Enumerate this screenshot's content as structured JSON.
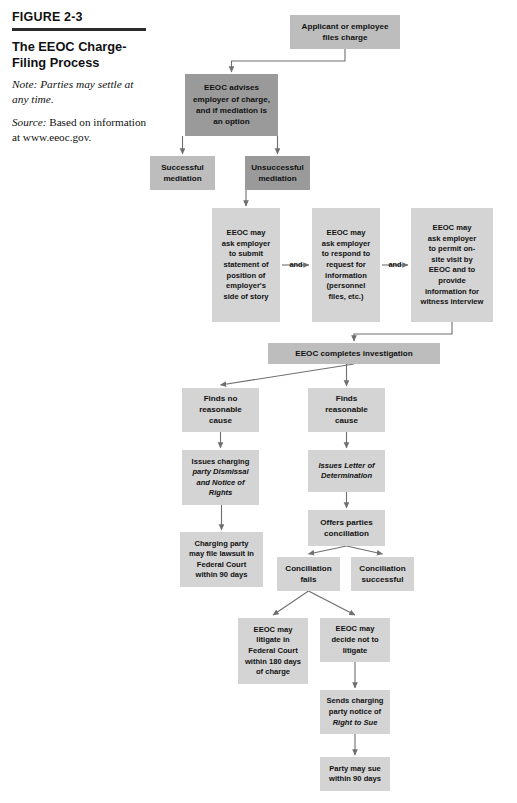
{
  "caption": {
    "figure_number": "FIGURE 2-3",
    "title": "The EEOC Charge-Filing Process",
    "note_label": "Note:",
    "note_text": "Note: Parties may settle at any time.",
    "source_label": "Source:",
    "source_text": "Based on information at www.eeoc.gov."
  },
  "colors": {
    "box_light": "#d4d4d4",
    "box_medium": "#bdbdbd",
    "box_dark": "#9a9a9a",
    "connector": "#6f6f6f",
    "rule": "#2b2b2b",
    "text": "#111111",
    "page_background": "#ffffff"
  },
  "chart_data": {
    "type": "flowchart",
    "title": "The EEOC Charge-Filing Process",
    "note": "Parties may settle at any time.",
    "source": "Based on information at www.eeoc.gov.",
    "nodes": [
      {
        "id": "applicant-files",
        "label": "Applicant or employee files charge",
        "lines": [
          "Applicant or employee",
          "files charge"
        ],
        "x": 290,
        "y": 15,
        "w": 110,
        "h": 34,
        "fill": "box_medium",
        "size": "big"
      },
      {
        "id": "eeoc-advises",
        "label": "EEOC advises employer of charge, and if mediation is an option",
        "lines": [
          "EEOC advises",
          "employer of charge,",
          "and if mediation is",
          "an option"
        ],
        "x": 185,
        "y": 74,
        "w": 93,
        "h": 62,
        "fill": "box_dark",
        "size": "big"
      },
      {
        "id": "successful-mediation",
        "label": "Successful mediation",
        "lines": [
          "Successful",
          "mediation"
        ],
        "x": 150,
        "y": 156,
        "w": 65,
        "h": 34,
        "fill": "box_medium",
        "size": "big"
      },
      {
        "id": "unsuccessful-mediation",
        "label": "Unsuccessful mediation",
        "lines": [
          "Unsuccessful",
          "mediation"
        ],
        "x": 245,
        "y": 156,
        "w": 65,
        "h": 34,
        "fill": "box_dark",
        "size": "big"
      },
      {
        "id": "ask-statement",
        "label": "EEOC may ask employer to submit statement of position of employer's side of story",
        "lines": [
          "EEOC may",
          "ask employer",
          "to submit",
          "statement of",
          "position of",
          "employer's",
          "side of story"
        ],
        "x": 212,
        "y": 208,
        "w": 68,
        "h": 114,
        "fill": "box_light",
        "size": "norm"
      },
      {
        "id": "ask-respond",
        "label": "EEOC may ask employer to respond to request for information (personnel files, etc.)",
        "lines": [
          "EEOC may",
          "ask employer",
          "to respond to",
          "request for",
          "information",
          "(personnel",
          "files, etc.)"
        ],
        "x": 312,
        "y": 208,
        "w": 68,
        "h": 114,
        "fill": "box_light",
        "size": "norm"
      },
      {
        "id": "ask-onsite",
        "label": "EEOC may ask employer to permit on-site visit by EEOC and to provide information for witness interview",
        "lines": [
          "EEOC may",
          "ask employer",
          "to permit on-",
          "site visit by",
          "EEOC and to",
          "provide",
          "information for",
          "witness interview"
        ],
        "x": 411,
        "y": 208,
        "w": 82,
        "h": 114,
        "fill": "box_light",
        "size": "norm"
      },
      {
        "id": "completes-investigation",
        "label": "EEOC completes investigation",
        "lines": [
          "EEOC completes investigation"
        ],
        "x": 268,
        "y": 343,
        "w": 172,
        "h": 21,
        "fill": "box_medium",
        "size": "big"
      },
      {
        "id": "finds-no-cause",
        "label": "Finds no reasonable cause",
        "lines": [
          "Finds no",
          "reasonable",
          "cause"
        ],
        "x": 182,
        "y": 388,
        "w": 77,
        "h": 44,
        "fill": "box_light",
        "size": "big"
      },
      {
        "id": "finds-cause",
        "label": "Finds reasonable cause",
        "lines": [
          "Finds",
          "reasonable",
          "cause"
        ],
        "x": 308,
        "y": 388,
        "w": 77,
        "h": 44,
        "fill": "box_light",
        "size": "big"
      },
      {
        "id": "issues-dismissal",
        "label": "Issues charging party Dismissal and Notice of Rights",
        "lines": [
          "Issues charging",
          "party Dismissal",
          "and Notice of",
          "Rights"
        ],
        "x": 182,
        "y": 450,
        "w": 77,
        "h": 55,
        "fill": "box_light",
        "size": "norm",
        "italic_lines": [
          false,
          true,
          true,
          true
        ]
      },
      {
        "id": "issues-letter",
        "label": "Issues Letter of Determination",
        "lines": [
          "Issues Letter of",
          "Determination"
        ],
        "x": 308,
        "y": 450,
        "w": 77,
        "h": 42,
        "fill": "box_light",
        "size": "norm",
        "italic_lines": [
          true,
          true
        ]
      },
      {
        "id": "charging-party-lawsuit",
        "label": "Charging party may file lawsuit in Federal Court within 90 days",
        "lines": [
          "Charging party",
          "may file lawsuit in",
          "Federal Court",
          "within 90 days"
        ],
        "x": 180,
        "y": 532,
        "w": 83,
        "h": 55,
        "fill": "box_light",
        "size": "norm"
      },
      {
        "id": "offers-conciliation",
        "label": "Offers parties conciliation",
        "lines": [
          "Offers parties",
          "conciliation"
        ],
        "x": 308,
        "y": 510,
        "w": 77,
        "h": 36,
        "fill": "box_light",
        "size": "big"
      },
      {
        "id": "conciliation-fails",
        "label": "Conciliation fails",
        "lines": [
          "Conciliation",
          "fails"
        ],
        "x": 277,
        "y": 557,
        "w": 63,
        "h": 34,
        "fill": "box_light",
        "size": "big"
      },
      {
        "id": "conciliation-successful",
        "label": "Conciliation successful",
        "lines": [
          "Conciliation",
          "successful"
        ],
        "x": 351,
        "y": 557,
        "w": 63,
        "h": 34,
        "fill": "box_light",
        "size": "big"
      },
      {
        "id": "eeoc-litigate",
        "label": "EEOC may litigate in Federal Court within 180 days of charge",
        "lines": [
          "EEOC may",
          "litigate in",
          "Federal Court",
          "within 180 days",
          "of charge"
        ],
        "x": 238,
        "y": 618,
        "w": 70,
        "h": 66,
        "fill": "box_light",
        "size": "norm"
      },
      {
        "id": "eeoc-not-litigate",
        "label": "EEOC may decide not to litigate",
        "lines": [
          "EEOC may",
          "decide not to",
          "litigate"
        ],
        "x": 320,
        "y": 618,
        "w": 70,
        "h": 44,
        "fill": "box_light",
        "size": "norm"
      },
      {
        "id": "sends-right-to-sue",
        "label": "Sends charging party notice of Right to Sue",
        "lines": [
          "Sends charging",
          "party notice of",
          "Right to Sue"
        ],
        "x": 320,
        "y": 690,
        "w": 70,
        "h": 44,
        "fill": "box_light",
        "size": "norm",
        "italic_lines": [
          false,
          false,
          true
        ]
      },
      {
        "id": "party-may-sue",
        "label": "Party may sue within 90 days",
        "lines": [
          "Party may sue",
          "within 90 days"
        ],
        "x": 320,
        "y": 757,
        "w": 70,
        "h": 34,
        "fill": "box_light",
        "size": "norm"
      }
    ],
    "edge_labels": [
      {
        "id": "and-1",
        "text": "and",
        "x": 296,
        "y": 265
      },
      {
        "id": "and-2",
        "text": "and",
        "x": 395,
        "y": 265
      }
    ],
    "edges": [
      {
        "from": "applicant-files",
        "to": "eeoc-advises",
        "kind": "elbow-down-left"
      },
      {
        "from": "eeoc-advises",
        "to": "successful-mediation",
        "kind": "vertical"
      },
      {
        "from": "eeoc-advises",
        "to": "unsuccessful-mediation",
        "kind": "vertical"
      },
      {
        "from": "unsuccessful-mediation",
        "to": "ask-statement",
        "kind": "vertical"
      },
      {
        "from": "ask-statement",
        "to": "ask-respond",
        "kind": "horizontal",
        "label": "and"
      },
      {
        "from": "ask-respond",
        "to": "ask-onsite",
        "kind": "horizontal",
        "label": "and"
      },
      {
        "from": "ask-onsite",
        "to": "completes-investigation",
        "kind": "elbow-down-left"
      },
      {
        "from": "completes-investigation",
        "to": "finds-no-cause",
        "kind": "diagonal"
      },
      {
        "from": "completes-investigation",
        "to": "finds-cause",
        "kind": "vertical"
      },
      {
        "from": "finds-no-cause",
        "to": "issues-dismissal",
        "kind": "vertical"
      },
      {
        "from": "issues-dismissal",
        "to": "charging-party-lawsuit",
        "kind": "vertical"
      },
      {
        "from": "finds-cause",
        "to": "issues-letter",
        "kind": "vertical"
      },
      {
        "from": "issues-letter",
        "to": "offers-conciliation",
        "kind": "vertical"
      },
      {
        "from": "offers-conciliation",
        "to": "conciliation-fails",
        "kind": "diagonal"
      },
      {
        "from": "offers-conciliation",
        "to": "conciliation-successful",
        "kind": "diagonal"
      },
      {
        "from": "conciliation-fails",
        "to": "eeoc-litigate",
        "kind": "diagonal"
      },
      {
        "from": "conciliation-fails",
        "to": "eeoc-not-litigate",
        "kind": "diagonal"
      },
      {
        "from": "eeoc-not-litigate",
        "to": "sends-right-to-sue",
        "kind": "vertical"
      },
      {
        "from": "sends-right-to-sue",
        "to": "party-may-sue",
        "kind": "vertical"
      }
    ]
  }
}
